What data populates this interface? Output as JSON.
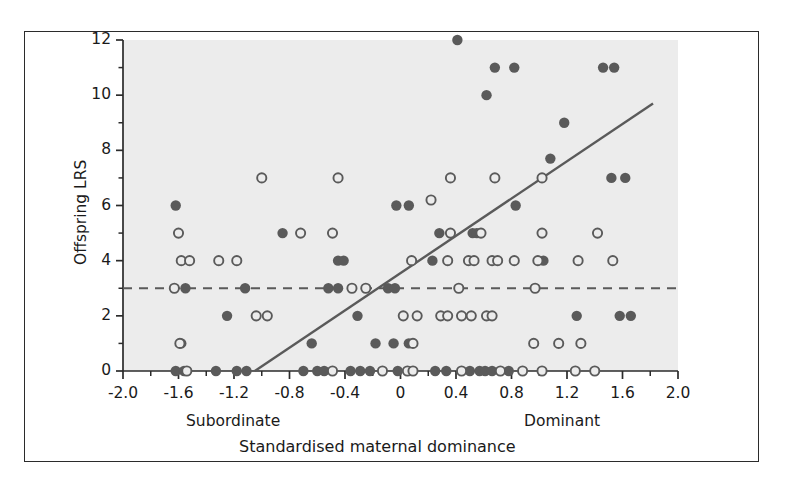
{
  "figure": {
    "background": "#ffffff",
    "frame_color": "#2b2b2b",
    "plot_background": "#ececec"
  },
  "chart_data": {
    "type": "scatter",
    "title": "",
    "xlabel": "Standardised maternal dominance",
    "ylabel": "Offspring LRS",
    "xlim": [
      -2.0,
      2.0
    ],
    "ylim": [
      0,
      12
    ],
    "grid": false,
    "legend_position": "none",
    "x_ticks": [
      "-2.0",
      "-1.6",
      "-1.2",
      "-0.8",
      "-0.4",
      "0",
      "0.4",
      "0.8",
      "1.2",
      "1.6",
      "2.0"
    ],
    "x_tick_values": [
      -2.0,
      -1.6,
      -1.2,
      -0.8,
      -0.4,
      0,
      0.4,
      0.8,
      1.2,
      1.6,
      2.0
    ],
    "x_minor_step": 0.2,
    "y_ticks": [
      "0",
      "2",
      "4",
      "6",
      "8",
      "10",
      "12"
    ],
    "y_tick_values": [
      0,
      2,
      4,
      6,
      8,
      10,
      12
    ],
    "y_minor_step": 1,
    "axis_end_labels": {
      "left": "Subordinate",
      "right": "Dominant"
    },
    "marker_colors": {
      "filled": "#5a5a5a",
      "open_stroke": "#5a5a5a",
      "open_fill": "#ececec"
    },
    "series": [
      {
        "name": "filled",
        "marker": "filled-circle",
        "color": "#5a5a5a",
        "points": [
          [
            0.41,
            12
          ],
          [
            0.68,
            11
          ],
          [
            0.82,
            11
          ],
          [
            1.46,
            11
          ],
          [
            1.54,
            11
          ],
          [
            0.62,
            10
          ],
          [
            1.18,
            9
          ],
          [
            1.08,
            7.7
          ],
          [
            1.52,
            7
          ],
          [
            1.62,
            7
          ],
          [
            -1.62,
            6
          ],
          [
            -0.03,
            6
          ],
          [
            0.06,
            6
          ],
          [
            0.83,
            6
          ],
          [
            -0.85,
            5
          ],
          [
            0.28,
            5
          ],
          [
            0.52,
            5
          ],
          [
            0.55,
            5
          ],
          [
            -0.45,
            4
          ],
          [
            -0.41,
            4
          ],
          [
            0.23,
            4
          ],
          [
            1.03,
            4
          ],
          [
            -1.55,
            3
          ],
          [
            -1.12,
            3
          ],
          [
            -0.52,
            3
          ],
          [
            -0.45,
            3
          ],
          [
            -0.09,
            3
          ],
          [
            -0.04,
            3
          ],
          [
            -1.25,
            2
          ],
          [
            -0.31,
            2
          ],
          [
            1.27,
            2
          ],
          [
            1.58,
            2
          ],
          [
            1.66,
            2
          ],
          [
            -1.58,
            1
          ],
          [
            -0.64,
            1
          ],
          [
            -0.18,
            1
          ],
          [
            -0.05,
            1
          ],
          [
            0.06,
            1
          ],
          [
            -1.62,
            0
          ],
          [
            -1.56,
            0
          ],
          [
            -1.33,
            0
          ],
          [
            -1.18,
            0
          ],
          [
            -1.11,
            0
          ],
          [
            -0.7,
            0
          ],
          [
            -0.6,
            0
          ],
          [
            -0.55,
            0
          ],
          [
            -0.36,
            0
          ],
          [
            -0.29,
            0
          ],
          [
            -0.22,
            0
          ],
          [
            -0.02,
            0
          ],
          [
            0.25,
            0
          ],
          [
            0.33,
            0
          ],
          [
            0.5,
            0
          ],
          [
            0.57,
            0
          ],
          [
            0.61,
            0
          ],
          [
            0.66,
            0
          ],
          [
            0.78,
            0
          ]
        ]
      },
      {
        "name": "open",
        "marker": "open-circle",
        "color": "#5a5a5a",
        "points": [
          [
            0.36,
            7
          ],
          [
            0.68,
            7
          ],
          [
            1.02,
            7
          ],
          [
            -1.0,
            7
          ],
          [
            -0.45,
            7
          ],
          [
            0.22,
            6.2
          ],
          [
            -1.6,
            5
          ],
          [
            -0.72,
            5
          ],
          [
            -0.49,
            5
          ],
          [
            0.36,
            5
          ],
          [
            0.58,
            5
          ],
          [
            1.02,
            5
          ],
          [
            1.42,
            5
          ],
          [
            -1.58,
            4
          ],
          [
            -1.52,
            4
          ],
          [
            -1.31,
            4
          ],
          [
            -1.18,
            4
          ],
          [
            0.08,
            4
          ],
          [
            0.34,
            4
          ],
          [
            0.49,
            4
          ],
          [
            0.53,
            4
          ],
          [
            0.66,
            4
          ],
          [
            0.7,
            4
          ],
          [
            0.82,
            4
          ],
          [
            0.99,
            4
          ],
          [
            1.28,
            4
          ],
          [
            1.53,
            4
          ],
          [
            -1.63,
            3
          ],
          [
            -0.35,
            3
          ],
          [
            -0.25,
            3
          ],
          [
            0.42,
            3
          ],
          [
            0.97,
            3
          ],
          [
            -1.04,
            2
          ],
          [
            -0.96,
            2
          ],
          [
            0.02,
            2
          ],
          [
            0.12,
            2
          ],
          [
            0.29,
            2
          ],
          [
            0.34,
            2
          ],
          [
            0.44,
            2
          ],
          [
            0.51,
            2
          ],
          [
            0.62,
            2
          ],
          [
            0.66,
            2
          ],
          [
            -1.59,
            1
          ],
          [
            0.09,
            1
          ],
          [
            0.96,
            1
          ],
          [
            1.14,
            1
          ],
          [
            1.3,
            1
          ],
          [
            -1.54,
            0
          ],
          [
            -0.49,
            0
          ],
          [
            -0.13,
            0
          ],
          [
            0.05,
            0
          ],
          [
            0.09,
            0
          ],
          [
            0.44,
            0
          ],
          [
            0.72,
            0
          ],
          [
            0.88,
            0
          ],
          [
            1.02,
            0
          ],
          [
            1.26,
            0
          ],
          [
            1.4,
            0
          ]
        ]
      }
    ],
    "lines": [
      {
        "name": "regression-line",
        "style": "solid",
        "color": "#5a5a5a",
        "x1": -1.05,
        "y1": 0.0,
        "x2": 1.82,
        "y2": 9.7
      },
      {
        "name": "reference-line",
        "style": "dashed",
        "color": "#5a5a5a",
        "x1": -2.0,
        "y1": 3.0,
        "x2": 2.0,
        "y2": 3.0
      }
    ]
  }
}
